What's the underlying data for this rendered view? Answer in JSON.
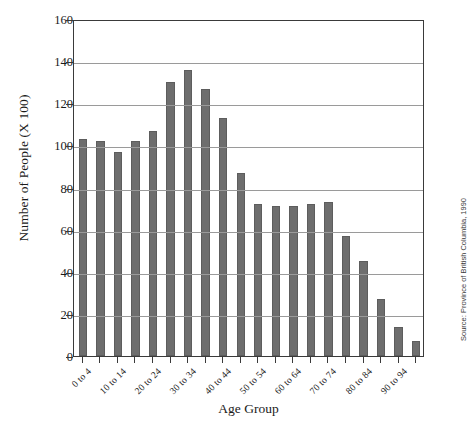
{
  "chart_data": {
    "type": "bar",
    "title": "",
    "xlabel": "Age Group",
    "ylabel": "Number of People (X 100)",
    "categories": [
      "0 to 4",
      "5 to 9",
      "10 to 14",
      "15 to 19",
      "20 to 24",
      "25 to 29",
      "30 to 34",
      "35 to 39",
      "40 to 44",
      "45 to 49",
      "50 to 54",
      "55 to 59",
      "60 to 64",
      "65 to 69",
      "70 to 74",
      "75 to 79",
      "80 to 84",
      "85 to 89",
      "90 to 94",
      "95 to 99"
    ],
    "visible_tick_labels": [
      "0 to 4",
      "",
      "10 to 14",
      "",
      "20 to 24",
      "",
      "30 to 34",
      "",
      "40 to 44",
      "",
      "50 to 54",
      "",
      "60 to 64",
      "",
      "70 to 74",
      "",
      "80 to 84",
      "",
      "90 to 94",
      ""
    ],
    "values": [
      103,
      102,
      97,
      102,
      107,
      130,
      136,
      127,
      113,
      87,
      72,
      71,
      71,
      72,
      73,
      57,
      45,
      27,
      14,
      7
    ],
    "ylim": [
      0,
      160
    ],
    "ytick_labels": [
      "0",
      "20",
      "40",
      "60",
      "80",
      "100",
      "120",
      "140",
      "160"
    ],
    "ytick_values": [
      0,
      20,
      40,
      60,
      80,
      100,
      120,
      140,
      160
    ],
    "grid": true,
    "legend": "none",
    "bar_color": "#6e6e6e",
    "gridline_color": "#9a9a9a",
    "axis_color": "#3a3a3a",
    "annotations": {
      "source": "Source: Province of British Columbia, 1990"
    }
  }
}
